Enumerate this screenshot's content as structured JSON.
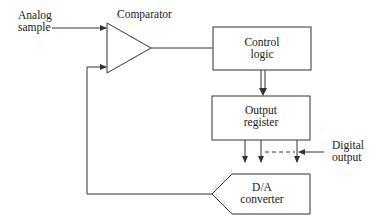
{
  "diagram": {
    "type": "block-diagram",
    "labels": {
      "analog_input": [
        "Analog",
        "sample"
      ],
      "comparator": "Comparator",
      "control_logic": [
        "Control",
        "logic"
      ],
      "output_register": [
        "Output",
        "register"
      ],
      "dac": [
        "D/A",
        "converter"
      ],
      "digital_output": [
        "Digital",
        "output"
      ]
    },
    "connections": [
      {
        "from": "analog_input",
        "to": "comparator"
      },
      {
        "from": "comparator",
        "to": "control_logic"
      },
      {
        "from": "control_logic",
        "to": "output_register",
        "style": "double"
      },
      {
        "from": "output_register",
        "to": "dac",
        "style": "parallel-bits"
      },
      {
        "from": "dac",
        "to": "comparator",
        "style": "feedback"
      }
    ],
    "colors": {
      "line": "#333333",
      "text": "#1a1a1a",
      "background": "#ffffff"
    }
  }
}
